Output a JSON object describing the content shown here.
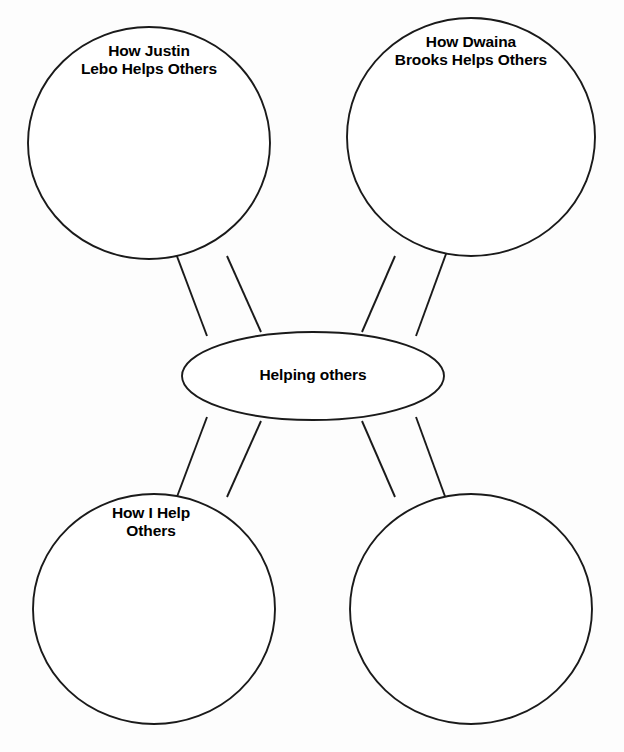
{
  "worksheet": {
    "type": "web-graphic-organizer",
    "center": {
      "label": "Helping others",
      "shape": "ellipse"
    },
    "branches": [
      {
        "label": "How Justin\nLebo Helps Others",
        "shape": "circle",
        "position": "top-left"
      },
      {
        "label": "How Dwaina\nBrooks Helps Others",
        "shape": "circle",
        "position": "top-right"
      },
      {
        "label": "How I Help\nOthers",
        "shape": "circle",
        "position": "bottom-left"
      },
      {
        "label": "",
        "shape": "circle",
        "position": "bottom-right"
      }
    ],
    "colors": {
      "background": "#fdfdfd",
      "stroke": "#1a1a1a",
      "fill": "#ffffff",
      "text": "#000000"
    }
  }
}
